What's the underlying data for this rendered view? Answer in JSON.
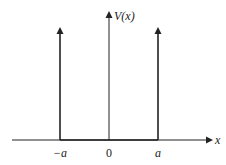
{
  "diagram": {
    "y_axis_label": "V(x)",
    "x_axis_label": "x",
    "tick_labels": [
      "−a",
      "0",
      "a"
    ],
    "spikes": [
      {
        "position_label": "−a"
      },
      {
        "position_label": "a"
      }
    ],
    "colors": {
      "line": "#222222",
      "background": "#ffffff"
    }
  }
}
